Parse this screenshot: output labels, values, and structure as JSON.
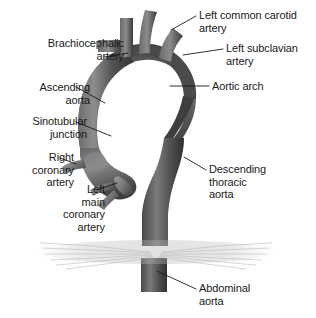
{
  "figure": {
    "background_color": "#ffffff",
    "width": 316,
    "height": 318
  },
  "palette": {
    "vessel_dark": "#3a3a3a",
    "vessel_mid": "#575757",
    "vessel_light": "#7c7c7c",
    "vessel_highlight": "#9a9a9a",
    "diaphragm": "#c9c9c9",
    "leader_line": "#1a1a1a",
    "text": "#1a1a1a"
  },
  "labels": [
    {
      "id": "left-common-carotid-artery",
      "text": "Left common carotid\nartery",
      "align": "left",
      "x": 199,
      "y": 9
    },
    {
      "id": "brachiocephalic-artery",
      "text": "Brachiocephalic\nartery",
      "align": "right",
      "x": 14,
      "y": 37
    },
    {
      "id": "left-subclavian-artery",
      "text": "Left subclavian\nartery",
      "align": "left",
      "x": 226,
      "y": 42
    },
    {
      "id": "ascending-aorta",
      "text": "Ascending\naorta",
      "align": "right",
      "x": 18,
      "y": 81
    },
    {
      "id": "aortic-arch",
      "text": "Aortic arch",
      "align": "left",
      "x": 212,
      "y": 80
    },
    {
      "id": "sinotubular-junction",
      "text": "Sinotubular\njunction",
      "align": "right",
      "x": 11,
      "y": 115
    },
    {
      "id": "right-coronary-artery",
      "text": "Right\ncoronary\nartery",
      "align": "right",
      "x": 4,
      "y": 151
    },
    {
      "id": "descending-thoracic-aorta",
      "text": "Descending\nthoracic\naorta",
      "align": "left",
      "x": 209,
      "y": 163
    },
    {
      "id": "left-main-coronary-artery",
      "text": "Left\nmain\ncoronary\nartery",
      "align": "right",
      "x": 43,
      "y": 183
    },
    {
      "id": "abdominal-aorta",
      "text": "Abdominal\naorta",
      "align": "left",
      "x": 199,
      "y": 282
    }
  ],
  "leader_lines": [
    {
      "id": "leader-left-common-carotid-artery",
      "points": "196,16 171,30"
    },
    {
      "id": "leader-brachiocephalic-artery",
      "points": "104,57 128,53"
    },
    {
      "id": "leader-left-subclavian-artery",
      "points": "223,49 183,55"
    },
    {
      "id": "leader-ascending-aorta",
      "points": "76,87 105,103"
    },
    {
      "id": "leader-aortic-arch",
      "points": "209,86 170,86"
    },
    {
      "id": "leader-sinotubular-junction",
      "points": "76,122 111,136"
    },
    {
      "id": "leader-right-coronary-artery",
      "points": "60,158 76,164"
    },
    {
      "id": "leader-descending-thoracic-aorta",
      "points": "206,170 184,157"
    },
    {
      "id": "leader-left-main-coronary-artery",
      "points": "97,190 117,183"
    },
    {
      "id": "leader-abdominal-aorta",
      "points": "196,289 157,271"
    }
  ]
}
